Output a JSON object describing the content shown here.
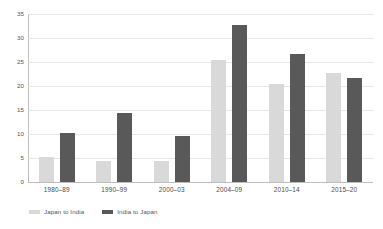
{
  "chart_data": {
    "type": "bar",
    "title": "",
    "subtitle": "",
    "xlabel": "",
    "ylabel": "",
    "categories": [
      "1980–89",
      "1990–99",
      "2000–03",
      "2004–09",
      "2010–14",
      "2015–20"
    ],
    "series": [
      {
        "name": "Japan to India",
        "color": "#d9d9d9",
        "values": [
          5.2,
          4.3,
          4.3,
          25.5,
          20.5,
          22.7
        ]
      },
      {
        "name": "India to Japan",
        "color": "#595959",
        "values": [
          10.2,
          14.4,
          9.5,
          32.7,
          26.6,
          21.7
        ]
      }
    ],
    "ylim": [
      0,
      35
    ],
    "yticks": [
      0,
      5,
      10,
      15,
      20,
      25,
      30,
      35
    ],
    "ytick_labels": [
      "0",
      "5",
      "10",
      "15",
      "20",
      "25",
      "30",
      "35"
    ],
    "grid": true,
    "grid_axis": "y",
    "legend_position": "bottom-left",
    "orientation": "vertical",
    "grouping": "clustered"
  },
  "colors": {
    "series_a": "#d9d9d9",
    "series_b": "#595959",
    "gridline": "#e6e6e6",
    "axis": "#bdbdbd",
    "text": "#555555",
    "background": "#ffffff"
  }
}
